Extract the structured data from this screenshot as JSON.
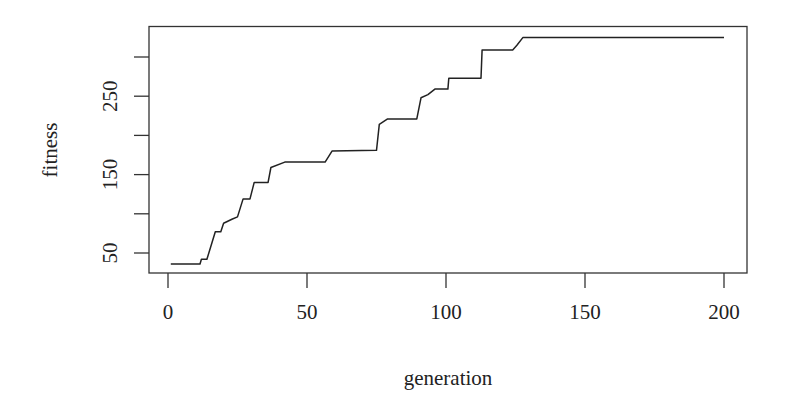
{
  "chart_data": {
    "type": "line",
    "title": "",
    "xlabel": "generation",
    "ylabel": "fitness",
    "xlim": [
      -7,
      207
    ],
    "ylim": [
      23,
      339
    ],
    "x_ticks": [
      0,
      50,
      100,
      150,
      200
    ],
    "x_tick_labels": [
      "0",
      "50",
      "100",
      "150",
      "200"
    ],
    "y_ticks": [
      50,
      100,
      150,
      200,
      250,
      300
    ],
    "y_tick_labels": [
      "50",
      "",
      "150",
      "",
      "250",
      ""
    ],
    "grid": false,
    "legend": null,
    "series": [
      {
        "name": "fitness",
        "color": "#222222",
        "x": [
          1,
          11.5,
          12,
          14,
          17,
          19,
          20,
          23,
          25,
          27,
          29.5,
          31,
          36,
          37,
          42,
          56.5,
          59,
          75,
          76,
          79,
          89.5,
          91,
          93.5,
          96,
          100.7,
          101,
          112.6,
          113,
          124,
          125.5,
          127.7,
          200
        ],
        "y": [
          36,
          36,
          42,
          42,
          77,
          77,
          88,
          93,
          96,
          119,
          119,
          140,
          140,
          159,
          166,
          166,
          180,
          181,
          214,
          221,
          221,
          248,
          252,
          259,
          259,
          273,
          273,
          309,
          309,
          315,
          325,
          325
        ]
      }
    ]
  }
}
